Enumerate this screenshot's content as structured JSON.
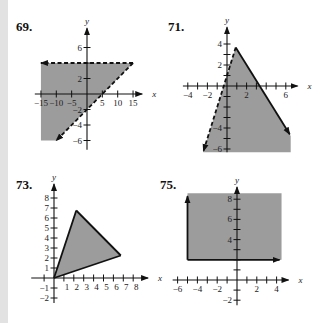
{
  "colors": {
    "shade": "#9c9c9c",
    "line": "#111111",
    "axis": "#111111",
    "band": "#e2e2e2"
  },
  "chart_data": [
    {
      "id": "69",
      "label": "69.",
      "type": "area",
      "xlabel": "x",
      "ylabel": "y",
      "xlim": [
        -15,
        15
      ],
      "ylim": [
        -6,
        6
      ],
      "x_tick_values": [
        -15,
        -10,
        -5,
        5,
        10,
        15
      ],
      "x_tick_labels": [
        "−15",
        "−10",
        "−5",
        "5",
        "10",
        "15"
      ],
      "y_tick_values": [
        6,
        2,
        -2,
        -4,
        -6
      ],
      "y_tick_labels": [
        "6",
        "2",
        "−2",
        "−4",
        "−6"
      ],
      "region": [
        [
          -15,
          4
        ],
        [
          15,
          4
        ],
        [
          -10,
          -6
        ],
        [
          -15,
          -6
        ]
      ],
      "boundaries": [
        {
          "from": [
            15,
            4
          ],
          "to": [
            -15,
            4
          ],
          "style": "dashed",
          "arrow": "end",
          "equation": "y = 4"
        },
        {
          "from": [
            15,
            4
          ],
          "to": [
            -10,
            -6
          ],
          "style": "dashed",
          "arrow": "end",
          "equation": "y = 0.4x - 2"
        }
      ]
    },
    {
      "id": "71",
      "label": "71.",
      "type": "area",
      "xlabel": "x",
      "ylabel": "y",
      "xlim": [
        -4,
        6
      ],
      "ylim": [
        -6,
        4
      ],
      "x_tick_values": [
        -4,
        -2,
        2,
        6
      ],
      "x_tick_labels": [
        "−4",
        "−2",
        "2",
        "6"
      ],
      "y_tick_values": [
        4,
        2,
        -4,
        -6
      ],
      "y_tick_labels": [
        "4",
        "2",
        "−4",
        "−6"
      ],
      "region": [
        [
          0.89,
          3.67
        ],
        [
          6.5,
          -4.75
        ],
        [
          6.5,
          -6.3
        ],
        [
          -2.43,
          -6.3
        ]
      ],
      "boundaries": [
        {
          "from": [
            0.89,
            3.67
          ],
          "to": [
            -2.4,
            -6.2
          ],
          "style": "dashed",
          "arrow": "end",
          "equation": "y = 3x + 1"
        },
        {
          "from": [
            0.89,
            3.67
          ],
          "to": [
            6.4,
            -4.6
          ],
          "style": "solid",
          "arrow": "end",
          "equation": "y = -1.5x + 5"
        }
      ]
    },
    {
      "id": "73",
      "label": "73.",
      "type": "area",
      "xlabel": "x",
      "ylabel": "y",
      "xlim": [
        -2,
        8
      ],
      "ylim": [
        -2,
        8
      ],
      "x_tick_values": [
        1,
        2,
        3,
        4,
        5,
        6,
        7,
        8
      ],
      "x_tick_labels": [
        "1",
        "2",
        "3",
        "4",
        "5",
        "6",
        "7",
        "8"
      ],
      "y_tick_values": [
        8,
        7,
        6,
        5,
        4,
        3,
        2,
        1,
        -1,
        -2
      ],
      "y_tick_labels": [
        "8",
        "7",
        "6",
        "5",
        "4",
        "3",
        "2",
        "1",
        "−1",
        "−2"
      ],
      "region": [
        [
          0,
          0
        ],
        [
          2.25,
          6.75
        ],
        [
          6.75,
          2.25
        ]
      ],
      "boundaries": [
        {
          "from": [
            0,
            0
          ],
          "to": [
            2.25,
            6.75
          ],
          "style": "solid",
          "arrow": "none"
        },
        {
          "from": [
            2.25,
            6.75
          ],
          "to": [
            6.75,
            2.25
          ],
          "style": "solid",
          "arrow": "none"
        },
        {
          "from": [
            6.75,
            2.25
          ],
          "to": [
            0,
            0
          ],
          "style": "solid",
          "arrow": "none"
        }
      ]
    },
    {
      "id": "75",
      "label": "75.",
      "type": "area",
      "xlabel": "x",
      "ylabel": "y",
      "xlim": [
        -6,
        4
      ],
      "ylim": [
        -2,
        8
      ],
      "x_tick_values": [
        -6,
        -4,
        -2,
        2,
        4
      ],
      "x_tick_labels": [
        "−6",
        "−4",
        "−2",
        "2",
        "4"
      ],
      "y_tick_values": [
        8,
        6,
        4,
        -2
      ],
      "y_tick_labels": [
        "8",
        "6",
        "4",
        "−2"
      ],
      "region": [
        [
          -5,
          8.6
        ],
        [
          4.5,
          8.6
        ],
        [
          4.5,
          2
        ],
        [
          -5,
          2
        ]
      ],
      "boundaries": [
        {
          "from": [
            -5,
            2
          ],
          "to": [
            -5,
            8.3
          ],
          "style": "solid",
          "arrow": "end",
          "equation": "x = -5"
        },
        {
          "from": [
            -5,
            2
          ],
          "to": [
            4.3,
            2
          ],
          "style": "solid",
          "arrow": "end",
          "equation": "y = 2"
        }
      ]
    }
  ]
}
